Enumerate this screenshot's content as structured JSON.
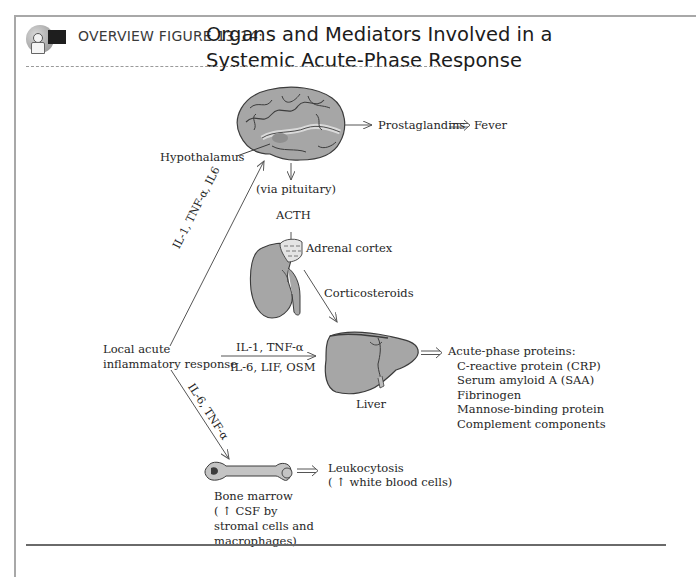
{
  "header": {
    "icon": "teacher-blackboard-icon",
    "figure_label": "OVERVIEW FIGURE 13-14:",
    "title_line1": "Organs and Mediators Involved in a",
    "title_line2": "Systemic Acute-Phase Response"
  },
  "diagram": {
    "brain": {
      "icon": "brain-icon",
      "output_arrow_label": "Prostaglandins",
      "result": "Fever",
      "hypothalamus_label": "Hypothalamus",
      "via_label": "(via pituitary)",
      "hormone_label": "ACTH"
    },
    "adrenal": {
      "icon": "kidney-adrenal-icon",
      "label": "Adrenal cortex",
      "output_label": "Corticosteroids"
    },
    "source": {
      "line1": "Local acute",
      "line2": "inflammatory response"
    },
    "upper_arrow_label": "IL-1, TNF-α, IL6",
    "middle_arrow_label_top": "IL-1, TNF-α",
    "middle_arrow_label_bottom": "IL-6, LIF, OSM",
    "lower_arrow_label": "IL-6, TNF-α",
    "liver": {
      "icon": "liver-icon",
      "label": "Liver",
      "output_heading": "Acute-phase proteins:",
      "outputs": [
        "C-reactive protein (CRP)",
        "Serum amyloid A (SAA)",
        "Fibrinogen",
        "Mannose-binding protein",
        "Complement components"
      ]
    },
    "bone_marrow": {
      "icon": "bone-icon",
      "label_line1": "Bone marrow",
      "label_line2": "( ↑  CSF by",
      "label_line3": "stromal cells and",
      "label_line4": "macrophages)",
      "result_line1": "Leukocytosis",
      "result_line2": "( ↑  white blood cells)"
    }
  },
  "colors": {
    "organ_fill": "#a6a6a6",
    "organ_outline": "#3c3c3c",
    "text": "#262626",
    "frame": "#a8a8a8"
  }
}
